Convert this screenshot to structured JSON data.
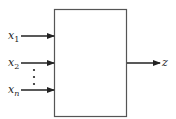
{
  "diagram": {
    "type": "block-diagram",
    "inputs": [
      {
        "var": "x",
        "sub": "1"
      },
      {
        "var": "x",
        "sub": "2"
      },
      {
        "var": "x",
        "sub": "n"
      }
    ],
    "ellipsis": "⋮",
    "output": {
      "var": "z"
    },
    "colors": {
      "stroke": "#333333",
      "background": "#ffffff"
    }
  }
}
